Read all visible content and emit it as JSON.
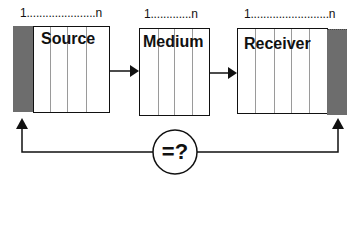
{
  "diagram": {
    "blocks": [
      {
        "id": "source",
        "label": "Source",
        "index_label": "1......................n"
      },
      {
        "id": "medium",
        "label": "Medium",
        "index_label": "1.............n"
      },
      {
        "id": "receiver",
        "label": "Receiver",
        "index_label": "1.........................n"
      }
    ],
    "comparison_symbol": "=?",
    "colors": {
      "line": "#111111",
      "shade": "#6d6d6d",
      "divider": "#9a9a9a"
    }
  }
}
